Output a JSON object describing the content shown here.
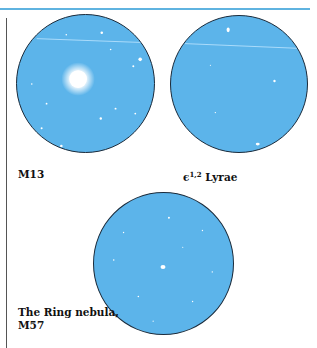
{
  "page": {
    "accent_color": "#5fb3e0",
    "field_color": "#5cb4ea"
  },
  "figures": [
    {
      "id": "m13",
      "label": "M13",
      "description": "Globular cluster, bright central concentration with satellite trail"
    },
    {
      "id": "epsilon-lyrae",
      "label_prefix": "ϵ",
      "label_sup": "1,2",
      "label_suffix": " Lyrae",
      "description": "Double-double star field with satellite trail"
    },
    {
      "id": "m57",
      "label_line1": "The Ring nebula,",
      "label_line2": "M57",
      "description": "Star field with small central nebula"
    }
  ]
}
